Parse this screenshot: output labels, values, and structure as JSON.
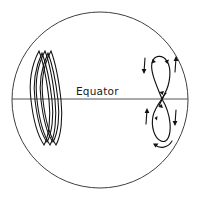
{
  "figure": {
    "background_color": "#ffffff",
    "line_color": "#111111",
    "outline_color": "#3f3f3f",
    "equator_color": "#555555",
    "width": 199,
    "height": 200
  },
  "globe": {
    "name": "globe-outline",
    "center_x": 100,
    "center_y": 100,
    "radius": 88
  },
  "equator": {
    "label": "Equator",
    "label_x": 76,
    "label_y": 95,
    "line_y": 99,
    "line_x1": 12,
    "line_x2": 188
  },
  "left_structure": {
    "name": "multi-loop-bundle",
    "description": "Bundle of narrow elongated loops crossing the equator",
    "loop_count": 4,
    "center_x": 46,
    "top_y": 50,
    "bottom_y": 146,
    "loops": [
      {
        "cx": 38,
        "half_width": 7.5,
        "tilt": 3
      },
      {
        "cx": 44,
        "half_width": 7.5,
        "tilt": 3
      },
      {
        "cx": 50,
        "half_width": 7.5,
        "tilt": 3
      },
      {
        "cx": 56,
        "half_width": 7.5,
        "tilt": 3
      }
    ]
  },
  "right_structure": {
    "name": "figure-eight-flux-loop",
    "description": "Figure-eight flux loop crossing the equator with flow arrows",
    "crossing_x": 162,
    "crossing_y": 99,
    "upper_loop_top_y": 56,
    "lower_loop_bottom_y": 143,
    "flow_arrow_count": 4,
    "loop_arrowhead_count": 5
  },
  "annotations": {
    "arrows": [
      {
        "name": "flow-arrow-upper-left",
        "direction": "down"
      },
      {
        "name": "flow-arrow-upper-right",
        "direction": "up"
      },
      {
        "name": "flow-arrow-lower-left",
        "direction": "up"
      },
      {
        "name": "flow-arrow-lower-right",
        "direction": "down"
      },
      {
        "name": "flow-arrow-bottom-curve",
        "direction": "counterclockwise"
      }
    ]
  }
}
